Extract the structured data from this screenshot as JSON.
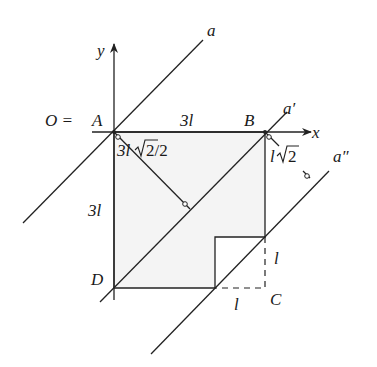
{
  "diagram": {
    "type": "geometry",
    "points": {
      "A": {
        "label": "A",
        "prefix": "O = "
      },
      "B": {
        "label": "B"
      },
      "C": {
        "label": "C"
      },
      "D": {
        "label": "D"
      }
    },
    "axes": {
      "x_label": "x",
      "y_label": "y"
    },
    "lines": {
      "a": "a",
      "a_prime": "a′",
      "a_double_prime": "a″"
    },
    "dimensions": {
      "top_side": "3l",
      "left_side": "3l",
      "cut_vertical": "l",
      "cut_horizontal": "l",
      "dist_A_to_a_prime_coeff": "3l",
      "dist_A_to_a_prime_rest": "2/2",
      "dist_B_to_a_double_prime_coeff": "l",
      "dist_B_to_a_double_prime_rest": "2"
    },
    "colors": {
      "line": "#222222",
      "region_fill": "#f4f4f4",
      "background": "#ffffff"
    }
  }
}
